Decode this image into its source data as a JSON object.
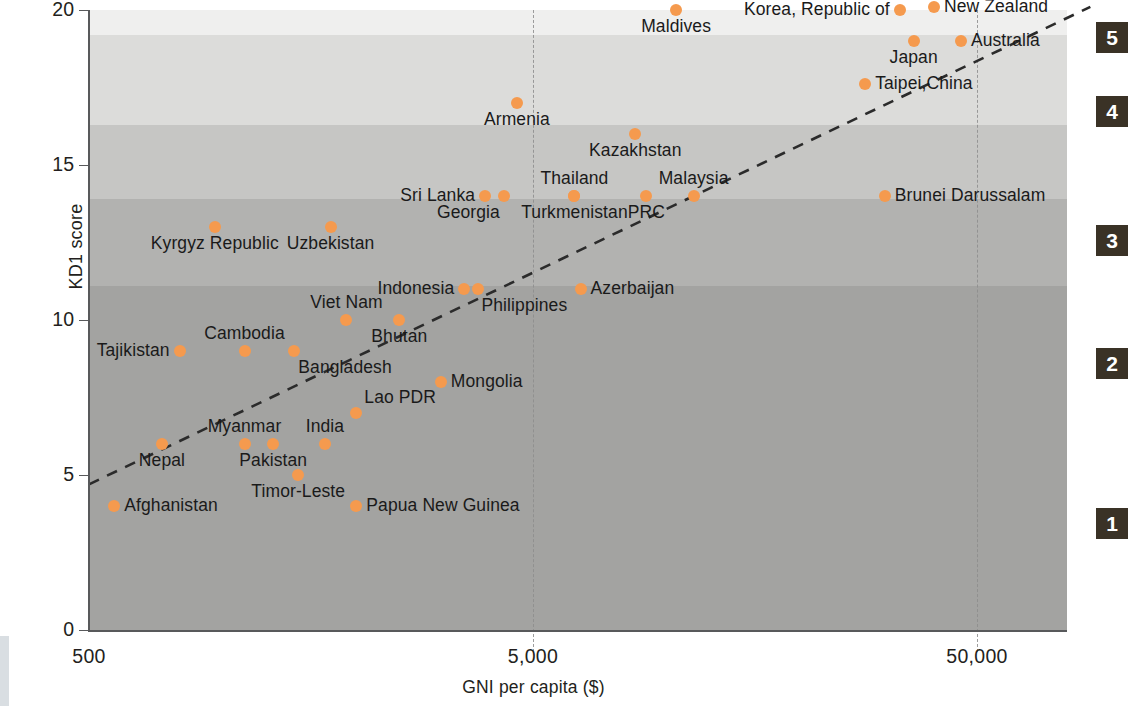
{
  "chart_data": {
    "type": "scatter",
    "title": "",
    "xlabel": "GNI per capita ($)",
    "ylabel": "KD1 score",
    "x_scale": "log",
    "xticks": [
      500,
      5000,
      50000
    ],
    "xtick_labels": [
      "500",
      "5,000",
      "50,000"
    ],
    "yticks": [
      0,
      5,
      10,
      15,
      20
    ],
    "ytick_labels": [
      "0",
      "5",
      "10",
      "15",
      "20"
    ],
    "ylim": [
      0,
      20
    ],
    "xlim": [
      500,
      110000
    ],
    "grid": "vertical dashed at 5,000 and 50,000",
    "legend": "none",
    "trendline": {
      "type": "dashed linear fit",
      "x0": 500,
      "y0": 4.7,
      "x1": 90000,
      "y1": 20.1
    },
    "bands": [
      {
        "group": "1",
        "label": "1",
        "y_from": 0.0,
        "y_to": 11.1,
        "color": "#a3a3a1"
      },
      {
        "group": "2",
        "label": "2",
        "y_from": 11.1,
        "y_to": 13.9,
        "color": "#b2b2b0"
      },
      {
        "group": "3",
        "label": "3",
        "y_from": 13.9,
        "y_to": 16.3,
        "color": "#c6c6c4"
      },
      {
        "group": "4",
        "label": "4",
        "y_from": 16.3,
        "y_to": 19.2,
        "color": "#dcdcda"
      },
      {
        "group": "5",
        "label": "5",
        "y_from": 19.2,
        "y_to": 20.0,
        "color": "#efefee"
      }
    ],
    "points": [
      {
        "name": "Afghanistan",
        "x": 570,
        "y": 4.0,
        "pos": "r"
      },
      {
        "name": "Nepal",
        "x": 730,
        "y": 6.0,
        "pos": "bc"
      },
      {
        "name": "Tajikistan",
        "x": 800,
        "y": 9.0,
        "pos": "lc"
      },
      {
        "name": "Kyrgyz Republic",
        "x": 960,
        "y": 13.0,
        "pos": "bc"
      },
      {
        "name": "Myanmar",
        "x": 1120,
        "y": 6.0,
        "pos": "tc"
      },
      {
        "name": "Cambodia",
        "x": 1120,
        "y": 9.0,
        "pos": "tc"
      },
      {
        "name": "Pakistan",
        "x": 1300,
        "y": 6.0,
        "pos": "bc"
      },
      {
        "name": "Bangladesh",
        "x": 1450,
        "y": 9.0,
        "pos": "br"
      },
      {
        "name": "Timor-Leste",
        "x": 1480,
        "y": 5.0,
        "pos": "bc"
      },
      {
        "name": "India",
        "x": 1700,
        "y": 6.0,
        "pos": "tc"
      },
      {
        "name": "Uzbekistan",
        "x": 1750,
        "y": 13.0,
        "pos": "bc"
      },
      {
        "name": "Viet Nam",
        "x": 1900,
        "y": 10.0,
        "pos": "tc"
      },
      {
        "name": "Lao PDR",
        "x": 2000,
        "y": 7.0,
        "pos": "tr"
      },
      {
        "name": "Papua New Guinea",
        "x": 2000,
        "y": 4.0,
        "pos": "r"
      },
      {
        "name": "Bhutan",
        "x": 2500,
        "y": 10.0,
        "pos": "bc"
      },
      {
        "name": "Mongolia",
        "x": 3100,
        "y": 8.0,
        "pos": "r"
      },
      {
        "name": "Indonesia",
        "x": 3500,
        "y": 11.0,
        "pos": "lc"
      },
      {
        "name": "Philippines",
        "x": 3750,
        "y": 11.0,
        "pos": "br"
      },
      {
        "name": "Sri Lanka",
        "x": 3900,
        "y": 14.0,
        "pos": "lc"
      },
      {
        "name": "Georgia",
        "x": 4300,
        "y": 14.0,
        "pos": "bl"
      },
      {
        "name": "Armenia",
        "x": 4600,
        "y": 17.0,
        "pos": "bc"
      },
      {
        "name": "Turkmenistan",
        "x": 6200,
        "y": 14.0,
        "pos": "bc"
      },
      {
        "name": "Thailand",
        "x": 6200,
        "y": 14.0,
        "pos": "tc"
      },
      {
        "name": "Azerbaijan",
        "x": 6400,
        "y": 11.0,
        "pos": "r"
      },
      {
        "name": "Kazakhstan",
        "x": 8500,
        "y": 16.0,
        "pos": "bc"
      },
      {
        "name": "PRC",
        "x": 9000,
        "y": 14.0,
        "pos": "bc"
      },
      {
        "name": "Maldives",
        "x": 10500,
        "y": 20.0,
        "pos": "bc"
      },
      {
        "name": "Malaysia",
        "x": 11500,
        "y": 14.0,
        "pos": "tc"
      },
      {
        "name": "Brunei Darussalam",
        "x": 31000,
        "y": 14.0,
        "pos": "r"
      },
      {
        "name": "Taipei,China",
        "x": 28000,
        "y": 17.6,
        "pos": "r"
      },
      {
        "name": "Korea, Republic of",
        "x": 33500,
        "y": 20.0,
        "pos": "lc"
      },
      {
        "name": "Japan",
        "x": 36000,
        "y": 19.0,
        "pos": "bc"
      },
      {
        "name": "New Zealand",
        "x": 40000,
        "y": 20.1,
        "pos": "r"
      },
      {
        "name": "Australia",
        "x": 46000,
        "y": 19.0,
        "pos": "r"
      }
    ]
  },
  "axis": {
    "y_title": "KD1 score",
    "x_title": "GNI per capita ($)",
    "y_ticks": [
      "20",
      "15",
      "10",
      "5",
      "0"
    ],
    "x_ticks": [
      "500",
      "5,000",
      "50,000"
    ]
  },
  "band_markers": [
    {
      "label": "5"
    },
    {
      "label": "4"
    },
    {
      "label": "3"
    },
    {
      "label": "2"
    },
    {
      "label": "1"
    }
  ],
  "colors": {
    "point": "#f59a4e",
    "marker_box": "#3a3226",
    "axis": "#58595b",
    "text": "#231f20"
  }
}
